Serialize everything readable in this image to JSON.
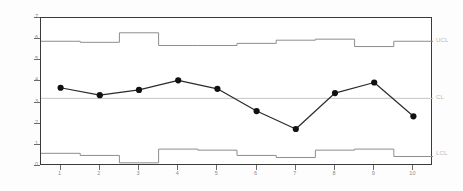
{
  "chart_data": {
    "type": "line",
    "title": "",
    "subtitle": "",
    "xlabel": "",
    "ylabel": "",
    "grid": false,
    "legend_position": "right",
    "xlim": [
      0.5,
      10.5
    ],
    "ylim": [
      0,
      7
    ],
    "x": [
      1,
      2,
      3,
      4,
      5,
      6,
      7,
      8,
      9,
      10
    ],
    "categories": [
      "1",
      "2",
      "3",
      "4",
      "5",
      "6",
      "7",
      "8",
      "9",
      "10"
    ],
    "xtick_labels": [
      "1",
      "2",
      "3",
      "4",
      "5",
      "6",
      "7",
      "8",
      "9",
      "10"
    ],
    "ytick_labels": [
      "7",
      "6",
      "5",
      "4",
      "3",
      "2",
      "1",
      "0"
    ],
    "ytick_values": [
      7,
      6,
      5,
      4,
      3,
      2,
      1,
      0
    ],
    "center_line_value": 3.2,
    "series": [
      {
        "name": "sample-mean",
        "role": "data",
        "marker": "filled-circle",
        "values": [
          3.7,
          3.35,
          3.6,
          4.05,
          3.65,
          2.6,
          1.75,
          3.45,
          3.95,
          2.35
        ]
      },
      {
        "name": "upper-control-limit",
        "role": "ucl",
        "style": "step",
        "values": [
          5.9,
          5.85,
          6.3,
          5.7,
          5.7,
          5.8,
          5.95,
          6.0,
          5.65,
          5.9
        ]
      },
      {
        "name": "center-line",
        "role": "center",
        "style": "horizontal",
        "values": [
          3.2,
          3.2,
          3.2,
          3.2,
          3.2,
          3.2,
          3.2,
          3.2,
          3.2,
          3.2
        ]
      },
      {
        "name": "lower-control-limit",
        "role": "lcl",
        "style": "step",
        "values": [
          0.6,
          0.5,
          0.15,
          0.8,
          0.75,
          0.5,
          0.4,
          0.75,
          0.8,
          0.45
        ]
      }
    ],
    "annotations": [
      {
        "name": "ucl-label",
        "text": "UCL",
        "value": 5.9
      },
      {
        "name": "center-label",
        "text": "CL",
        "value": 3.2
      },
      {
        "name": "lcl-label",
        "text": "LCL",
        "value": 0.55
      }
    ],
    "colors": {
      "data_line": "#2b2b2b",
      "marker": "#111111",
      "limit_line": "#8d8d8d",
      "center_line": "#c4c4c4",
      "frame": "#3a3a3a",
      "tick_text": "#8a8a8a",
      "annotation_text": "#b9b9b9",
      "background": "#ffffff"
    }
  }
}
